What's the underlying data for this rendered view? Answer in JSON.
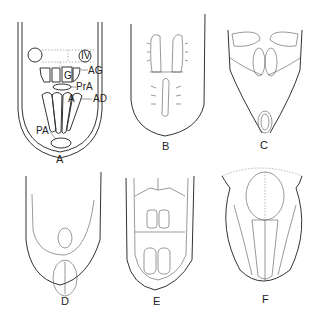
{
  "figure": {
    "panels": [
      {
        "id": "A",
        "label": "A"
      },
      {
        "id": "B",
        "label": "B"
      },
      {
        "id": "C",
        "label": "C"
      },
      {
        "id": "D",
        "label": "D"
      },
      {
        "id": "E",
        "label": "E"
      },
      {
        "id": "F",
        "label": "F"
      }
    ],
    "annotations_A": {
      "iv": "IV",
      "g": "G",
      "ag": "AG",
      "pra": "PrA",
      "a": "A",
      "ad": "AD",
      "pa": "PA"
    }
  }
}
